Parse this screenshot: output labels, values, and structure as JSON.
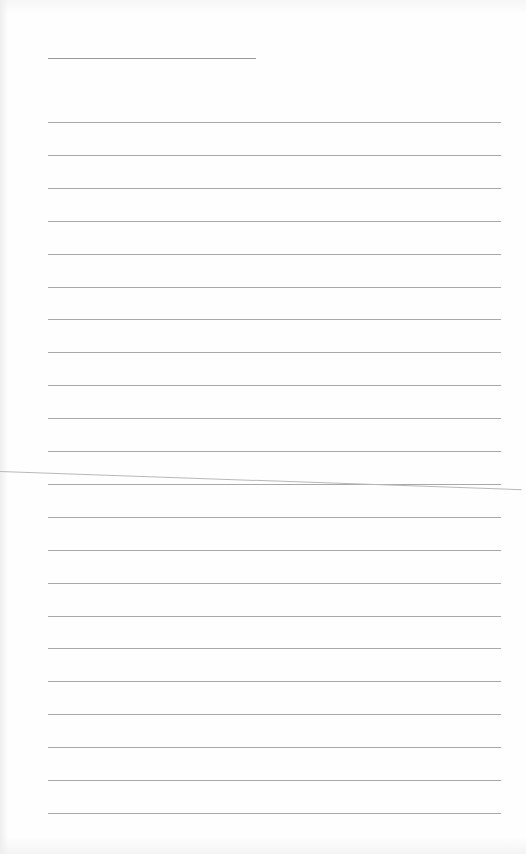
{
  "document": {
    "type": "lined-paper",
    "title_line": {
      "top": 58,
      "left": 48,
      "width": 208
    },
    "rules": {
      "count": 22,
      "first_top": 122,
      "spacing": 32.9,
      "left": 48,
      "width": 453
    },
    "colors": {
      "paper": "#fefefe",
      "rule": "#a8a8a8",
      "title_line": "#9a9a9a",
      "crease": "#b8b8b8"
    },
    "text": []
  }
}
